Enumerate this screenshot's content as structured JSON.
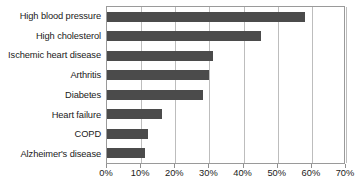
{
  "chart_data": {
    "type": "bar",
    "orientation": "horizontal",
    "title": "",
    "subtitle": "",
    "xlabel": "",
    "ylabel": "",
    "xlim": [
      0,
      70
    ],
    "x_tick_labels": [
      "0%",
      "10%",
      "20%",
      "30%",
      "40%",
      "50%",
      "60%",
      "70%"
    ],
    "x_tick_values": [
      0,
      10,
      20,
      30,
      40,
      50,
      60,
      70
    ],
    "grid": "vertical",
    "legend": null,
    "legend_position": "none",
    "bar_color": "#4b4b4b",
    "gridline_color": "#bdbdbd",
    "axis_color": "#9a9a9a",
    "categories": [
      "High blood pressure",
      "High cholesterol",
      "Ischemic heart disease",
      "Arthritis",
      "Diabetes",
      "Heart failure",
      "COPD",
      "Alzheimer's disease"
    ],
    "values": [
      58,
      45,
      31,
      30,
      28,
      16,
      12,
      11
    ],
    "value_labels": [
      "58%",
      "45%",
      "31%",
      "30%",
      "28%",
      "16%",
      "12%",
      "11%"
    ],
    "series": [
      {
        "name": "Prevalence",
        "values": [
          58,
          45,
          31,
          30,
          28,
          16,
          12,
          11
        ]
      }
    ]
  }
}
